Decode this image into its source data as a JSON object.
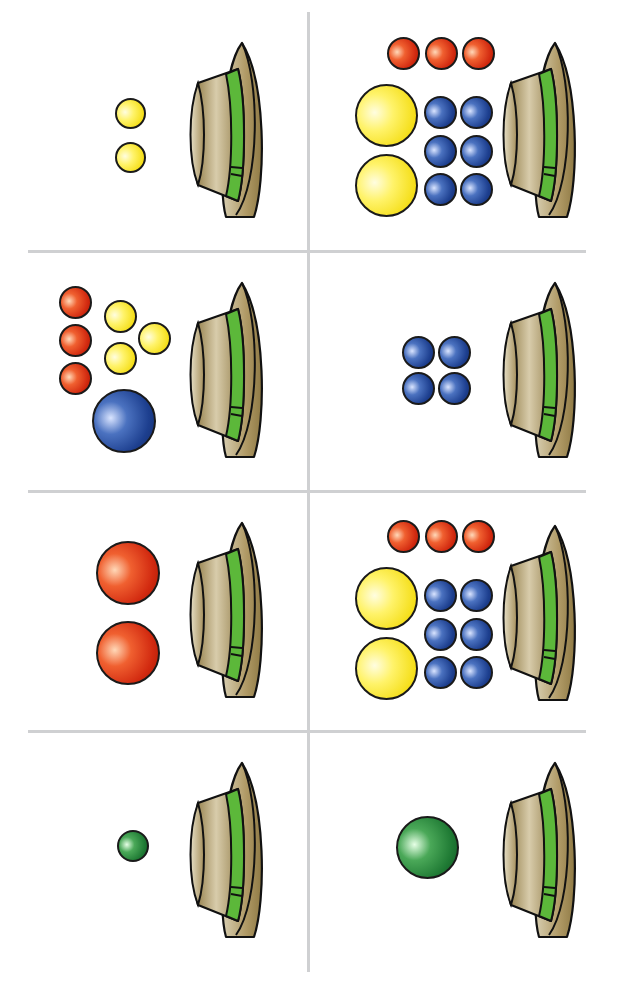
{
  "worksheet": {
    "layout": {
      "columns": 2,
      "rows": 4
    },
    "colors": {
      "yellow": "#f5df1c",
      "red": "#d22a10",
      "blue": "#1d3f8f",
      "green": "#1f7a34",
      "hat_body": "#a8915e",
      "hat_band": "#5cb83a",
      "divider": "#cfd0d2"
    },
    "icons": {
      "hat": "hat-icon",
      "ball": "ball-icon"
    },
    "cells": [
      {
        "id": "r1c1",
        "hat": true,
        "balls": [
          {
            "color": "yellow",
            "size": "small",
            "count": 2
          }
        ]
      },
      {
        "id": "r1c2",
        "hat": true,
        "balls": [
          {
            "color": "red",
            "size": "small",
            "count": 3
          },
          {
            "color": "yellow",
            "size": "large",
            "count": 2
          },
          {
            "color": "blue",
            "size": "small",
            "count": 6
          }
        ]
      },
      {
        "id": "r2c1",
        "hat": true,
        "balls": [
          {
            "color": "red",
            "size": "small",
            "count": 3
          },
          {
            "color": "yellow",
            "size": "small",
            "count": 3
          },
          {
            "color": "blue",
            "size": "large",
            "count": 1
          }
        ]
      },
      {
        "id": "r2c2",
        "hat": true,
        "balls": [
          {
            "color": "blue",
            "size": "small",
            "count": 4
          }
        ]
      },
      {
        "id": "r3c1",
        "hat": true,
        "balls": [
          {
            "color": "red",
            "size": "large",
            "count": 2
          }
        ]
      },
      {
        "id": "r3c2",
        "hat": true,
        "balls": [
          {
            "color": "red",
            "size": "small",
            "count": 3
          },
          {
            "color": "yellow",
            "size": "large",
            "count": 2
          },
          {
            "color": "blue",
            "size": "small",
            "count": 6
          }
        ]
      },
      {
        "id": "r4c1",
        "hat": true,
        "balls": [
          {
            "color": "green",
            "size": "small",
            "count": 1
          }
        ]
      },
      {
        "id": "r4c2",
        "hat": true,
        "balls": [
          {
            "color": "green",
            "size": "large",
            "count": 1
          }
        ]
      }
    ]
  }
}
